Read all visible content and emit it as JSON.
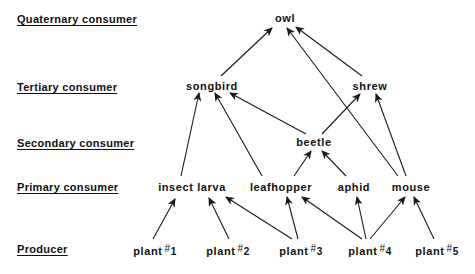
{
  "levels": [
    {
      "id": "quaternary",
      "label": "Quaternary consumer",
      "y": 13
    },
    {
      "id": "tertiary",
      "label": "Tertiary consumer",
      "y": 81
    },
    {
      "id": "secondary",
      "label": "Secondary consumer",
      "y": 137
    },
    {
      "id": "primary",
      "label": "Primary consumer",
      "y": 181
    },
    {
      "id": "producer",
      "label": "Producer",
      "y": 243
    }
  ],
  "nodes": {
    "owl": {
      "label": "owl",
      "x": 285,
      "y": 12
    },
    "songbird": {
      "label": "songbird",
      "x": 212,
      "y": 80
    },
    "shrew": {
      "label": "shrew",
      "x": 370,
      "y": 80
    },
    "beetle": {
      "label": "beetle",
      "x": 314,
      "y": 136
    },
    "insect_larva": {
      "label": "insect larva",
      "x": 192,
      "y": 181
    },
    "leafhopper": {
      "label": "leafhopper",
      "x": 281,
      "y": 181
    },
    "aphid": {
      "label": "aphid",
      "x": 354,
      "y": 181
    },
    "mouse": {
      "label": "mouse",
      "x": 411,
      "y": 181
    },
    "plant1": {
      "label": "plant",
      "num": "1",
      "x": 155,
      "y": 243
    },
    "plant2": {
      "label": "plant",
      "num": "2",
      "x": 228,
      "y": 243
    },
    "plant3": {
      "label": "plant",
      "num": "3",
      "x": 301,
      "y": 243
    },
    "plant4": {
      "label": "plant",
      "num": "4",
      "x": 370,
      "y": 243
    },
    "plant5": {
      "label": "plant",
      "num": "5",
      "x": 437,
      "y": 243
    }
  },
  "hash_symbol": "#",
  "edges": [
    {
      "from": "plant1",
      "to": "insect_larva",
      "x1": 153,
      "y1": 239,
      "x2": 175,
      "y2": 199
    },
    {
      "from": "plant2",
      "to": "insect_larva",
      "x1": 229,
      "y1": 239,
      "x2": 209,
      "y2": 198
    },
    {
      "from": "plant3",
      "to": "insect_larva",
      "x1": 292,
      "y1": 239,
      "x2": 226,
      "y2": 197
    },
    {
      "from": "plant3",
      "to": "leafhopper",
      "x1": 298,
      "y1": 239,
      "x2": 287,
      "y2": 197
    },
    {
      "from": "plant4",
      "to": "leafhopper",
      "x1": 362,
      "y1": 239,
      "x2": 302,
      "y2": 197
    },
    {
      "from": "plant4",
      "to": "aphid",
      "x1": 366,
      "y1": 239,
      "x2": 357,
      "y2": 197
    },
    {
      "from": "plant4",
      "to": "mouse",
      "x1": 370,
      "y1": 239,
      "x2": 405,
      "y2": 197
    },
    {
      "from": "plant5",
      "to": "mouse",
      "x1": 434,
      "y1": 239,
      "x2": 414,
      "y2": 197
    },
    {
      "from": "insect_larva",
      "to": "songbird",
      "x1": 181,
      "y1": 176,
      "x2": 199,
      "y2": 93
    },
    {
      "from": "leafhopper",
      "to": "songbird",
      "x1": 262,
      "y1": 176,
      "x2": 215,
      "y2": 93
    },
    {
      "from": "beetle",
      "to": "songbird",
      "x1": 306,
      "y1": 134,
      "x2": 230,
      "y2": 93
    },
    {
      "from": "leafhopper",
      "to": "beetle",
      "x1": 294,
      "y1": 176,
      "x2": 311,
      "y2": 151
    },
    {
      "from": "aphid",
      "to": "beetle",
      "x1": 346,
      "y1": 176,
      "x2": 322,
      "y2": 151
    },
    {
      "from": "beetle",
      "to": "shrew",
      "x1": 322,
      "y1": 134,
      "x2": 360,
      "y2": 94
    },
    {
      "from": "mouse",
      "to": "shrew",
      "x1": 406,
      "y1": 176,
      "x2": 376,
      "y2": 94
    },
    {
      "from": "mouse",
      "to": "owl",
      "x1": 398,
      "y1": 176,
      "x2": 287,
      "y2": 28
    },
    {
      "from": "songbird",
      "to": "owl",
      "x1": 221,
      "y1": 76,
      "x2": 272,
      "y2": 28
    },
    {
      "from": "shrew",
      "to": "owl",
      "x1": 362,
      "y1": 76,
      "x2": 296,
      "y2": 27
    }
  ]
}
